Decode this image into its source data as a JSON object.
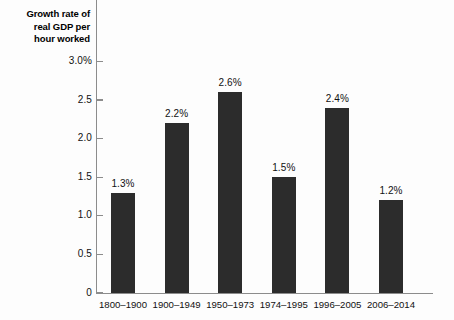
{
  "chart_data": {
    "type": "bar",
    "title": "",
    "ylabel": "Growth rate of\nreal GDP per\nhour worked",
    "xlabel": "",
    "categories": [
      "1800–1900",
      "1900–1949",
      "1950–1973",
      "1974–1995",
      "1996–2005",
      "2006–2014"
    ],
    "values": [
      1.3,
      2.2,
      2.6,
      1.5,
      2.4,
      1.2
    ],
    "value_labels": [
      "1.3%",
      "2.2%",
      "2.6%",
      "1.5%",
      "2.4%",
      "1.2%"
    ],
    "ylim": [
      0,
      3.0
    ],
    "ytick_values": [
      3.0,
      2.5,
      2.0,
      1.5,
      1.0,
      0.5,
      0
    ],
    "ytick_labels": [
      "3.0%",
      "2.5",
      "2.0",
      "1.5",
      "1.0",
      "0.5",
      "0"
    ],
    "grid": false,
    "legend": null,
    "bar_color": "#2c2c2c",
    "axis_color": "#8c8c8c",
    "background_color": "#fdfdfd"
  }
}
